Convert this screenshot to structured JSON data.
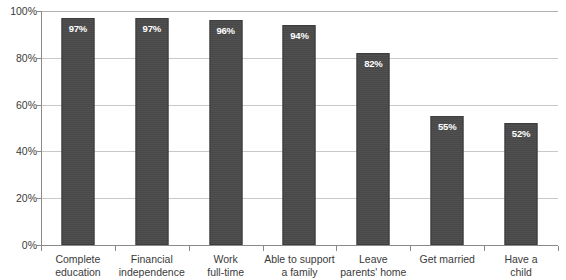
{
  "chart_data": {
    "type": "bar",
    "title": "",
    "subtitle": "",
    "xlabel": "",
    "ylabel": "",
    "ylim": [
      0,
      100
    ],
    "yticks": [
      "0%",
      "20%",
      "40%",
      "60%",
      "80%",
      "100%"
    ],
    "ytick_values": [
      0,
      20,
      40,
      60,
      80,
      100
    ],
    "grid": true,
    "legend": "none",
    "value_suffix": "%",
    "bar_color": "#4a4a4a",
    "label_color": "#ffffff",
    "gridline_color": "#c9c9c9",
    "axis_color": "#8a8a8a",
    "categories": [
      "Complete education",
      "Financial independence",
      "Work full-time",
      "Able to support a family",
      "Leave parents' home",
      "Get married",
      "Have a child"
    ],
    "category_lines": [
      [
        "Complete",
        "education"
      ],
      [
        "Financial",
        "independence"
      ],
      [
        "Work",
        "full-time"
      ],
      [
        "Able to support",
        "a family"
      ],
      [
        "Leave",
        "parents' home"
      ],
      [
        "Get married",
        ""
      ],
      [
        "Have a",
        "child"
      ]
    ],
    "values": [
      97,
      97,
      96,
      94,
      82,
      55,
      52
    ],
    "value_labels": [
      "97%",
      "97%",
      "96%",
      "94%",
      "82%",
      "55%",
      "52%"
    ]
  }
}
